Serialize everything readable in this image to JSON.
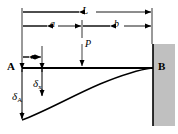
{
  "figure": {
    "colors": {
      "line": "#000000",
      "wall_fill": "#c0c0c0",
      "wall_edge": "#000000",
      "background": "#ffffff"
    },
    "labels": {
      "span_total": "L",
      "span_left": "a",
      "span_right": "b",
      "load": "P",
      "distance_x": "x",
      "node_free": "A",
      "node_fixed": "B",
      "deflection_tip_symbol": "δ",
      "deflection_tip_subscript": "A",
      "deflection_x_symbol": "δ",
      "deflection_x_subscript": "x"
    },
    "geometry": {
      "beam_y": 68,
      "left_end_x": 22,
      "right_end_x": 152,
      "load_x": 82,
      "x_station": 42,
      "tip_deflection_y": 120,
      "x_deflection_y": 97,
      "dim_L_y": 12,
      "dim_ab_y": 26,
      "wall_left": 153,
      "wall_right": 175,
      "wall_top": 44,
      "wall_bottom": 126
    }
  }
}
